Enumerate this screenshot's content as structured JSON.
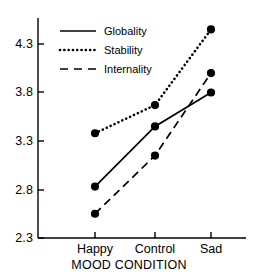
{
  "chart_data": {
    "type": "line",
    "title": "",
    "subtitle": "",
    "xlabel": "MOOD CONDITION",
    "ylabel": "",
    "categories": [
      "Happy",
      "Control",
      "Sad"
    ],
    "ylim": [
      2.3,
      4.55
    ],
    "yticks": [
      "2.3",
      "2.8",
      "3.3",
      "3.8",
      "4.3"
    ],
    "ytick_values": [
      2.3,
      2.8,
      3.3,
      3.8,
      4.3
    ],
    "grid": false,
    "legend_position": "top-left inside plot area",
    "series": [
      {
        "name": "Globality",
        "style": "solid",
        "marker": "filled-circle",
        "color": "#000000",
        "values": [
          2.83,
          3.45,
          3.8
        ]
      },
      {
        "name": "Stability",
        "style": "dotted",
        "marker": "filled-circle",
        "color": "#000000",
        "values": [
          3.38,
          3.67,
          4.45
        ]
      },
      {
        "name": "Internality",
        "style": "dashed",
        "marker": "filled-circle",
        "color": "#000000",
        "values": [
          2.55,
          3.15,
          4.0
        ]
      }
    ]
  },
  "legend": {
    "entries": [
      {
        "label": "Globality"
      },
      {
        "label": "Stability"
      },
      {
        "label": "Internality"
      }
    ]
  },
  "axes": {
    "y_tick_labels": [
      "4.3",
      "3.8",
      "3.3",
      "2.8",
      "2.3"
    ],
    "x_tick_labels": [
      "Happy",
      "Control",
      "Sad"
    ],
    "x_axis_title": "MOOD CONDITION"
  }
}
